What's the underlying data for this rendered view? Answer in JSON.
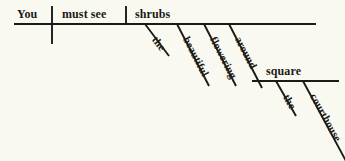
{
  "diagram": {
    "type": "reed-kellogg-sentence-diagram",
    "sentence": "You must see the beautiful flowering shrubs around the courthouse square.",
    "background_color": "#faf9f1",
    "line_color": "#1a1a17",
    "text_color": "#1a1a17",
    "baseline": {
      "subject": "You",
      "verb": "must see",
      "direct_object": "shrubs"
    },
    "modifiers": {
      "shrubs_article": "the",
      "shrubs_adj_1": "beautiful",
      "shrubs_adj_2": "flowering",
      "preposition": "around",
      "prep_object": "square",
      "square_article": "the",
      "square_modifier": "courthouse"
    },
    "labels": {
      "you": "You",
      "must_see": "must see",
      "shrubs": "shrubs",
      "the_1": "the",
      "beautiful": "beautiful",
      "flowering": "flowering",
      "around": "around",
      "square": "square",
      "the_2": "the",
      "courthouse": "courthouse"
    }
  }
}
